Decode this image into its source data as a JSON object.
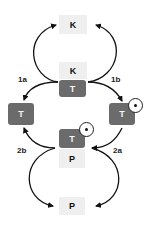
{
  "nodes": {
    "k_top": "K",
    "k_mid": "K",
    "t_mid": "T",
    "t_left": "T",
    "t_right": "T",
    "t_center_low": "T",
    "p_mid": "P",
    "p_bottom": "P"
  },
  "labels": {
    "l1a": "1a",
    "l1b": "1b",
    "l2a": "2a",
    "l2b": "2b"
  },
  "colors": {
    "dark_box": "#6b6b6b",
    "light_box": "#efefef",
    "arrow": "#111111"
  }
}
